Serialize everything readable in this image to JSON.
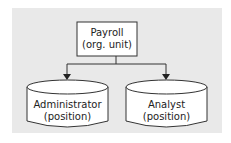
{
  "diagram": {
    "root": {
      "title": "Payroll",
      "subtitle": "(org. unit)"
    },
    "children": [
      {
        "title": "Administrator",
        "subtitle": "(position)"
      },
      {
        "title": "Analyst",
        "subtitle": "(position)"
      }
    ],
    "colors": {
      "background": "#e9e9e9",
      "node_fill": "#ffffff",
      "stroke": "#333333"
    }
  }
}
